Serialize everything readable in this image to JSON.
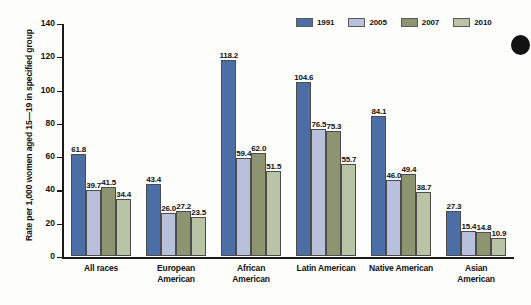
{
  "chart_data": {
    "type": "bar",
    "title": "",
    "xlabel": "",
    "ylabel": "Rate per 1,000 women aged 15—19 in specified group",
    "ylim": [
      0,
      140
    ],
    "yticks": [
      0,
      20,
      40,
      60,
      80,
      100,
      120,
      140
    ],
    "grid": false,
    "legend_position": "top-right",
    "categories": [
      "All races",
      "European American",
      "African American",
      "Latin American",
      "Native American",
      "Asian American"
    ],
    "category_lines": [
      [
        "All races"
      ],
      [
        "European",
        "American"
      ],
      [
        "African",
        "American"
      ],
      [
        "Latin American"
      ],
      [
        "Native American"
      ],
      [
        "Asian",
        "American"
      ]
    ],
    "series": [
      {
        "name": "1991",
        "color": "#4a6ea5",
        "values": [
          61.8,
          43.4,
          118.2,
          104.6,
          84.1,
          27.3
        ],
        "labels": [
          "61.8",
          "43.4",
          "118.2",
          "104.6",
          "84.1",
          "27.3"
        ]
      },
      {
        "name": "2005",
        "color": "#b8c0dc",
        "values": [
          39.7,
          26.0,
          59.4,
          76.5,
          46.0,
          15.4
        ],
        "labels": [
          "39.7",
          "26.0",
          "59.4",
          "76.5",
          "46.0",
          "15.4"
        ]
      },
      {
        "name": "2007",
        "color": "#8c9470",
        "values": [
          41.5,
          27.2,
          62.0,
          75.3,
          49.4,
          14.8
        ],
        "labels": [
          "41.5",
          "27.2",
          "62.0",
          "75.3",
          "49.4",
          "14.8"
        ]
      },
      {
        "name": "2010",
        "color": "#b9c3a6",
        "values": [
          34.4,
          23.5,
          51.5,
          55.7,
          38.7,
          10.9
        ],
        "labels": [
          "34.4",
          "23.5",
          "51.5",
          "55.7",
          "38.7",
          "10.9"
        ]
      }
    ]
  },
  "legend": {
    "entries": [
      {
        "label": "1991",
        "color": "#4a6ea5"
      },
      {
        "label": "2005",
        "color": "#b8c0dc"
      },
      {
        "label": "2007",
        "color": "#8c9470"
      },
      {
        "label": "2010",
        "color": "#b9c3a6"
      }
    ]
  },
  "axis": {
    "y_title": "Rate per 1,000 women aged 15—19 in specified group",
    "y_tick_labels": [
      "140",
      "120",
      "100",
      "80",
      "60",
      "40",
      "20",
      "0"
    ]
  }
}
